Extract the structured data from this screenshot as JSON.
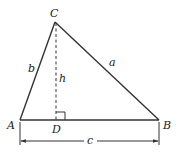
{
  "diagram": {
    "type": "triangle-altitude",
    "vertices": {
      "A": {
        "label": "A",
        "x": 20,
        "y": 120
      },
      "B": {
        "label": "B",
        "x": 159,
        "y": 120
      },
      "C": {
        "label": "C",
        "x": 55,
        "y": 22
      }
    },
    "foot": {
      "label": "D",
      "x": 56,
      "y": 120
    },
    "sides": {
      "a": {
        "label": "a",
        "from": "C",
        "to": "B"
      },
      "b": {
        "label": "b",
        "from": "A",
        "to": "C"
      },
      "c": {
        "label": "c",
        "from": "A",
        "to": "B"
      }
    },
    "altitude": {
      "label": "h",
      "from": "C",
      "to": "D",
      "style": "dashed"
    },
    "right_angle_marker": {
      "at": "D"
    },
    "dimension": {
      "label": "c",
      "from": "A",
      "to": "B"
    },
    "colors": {
      "stroke": "#333333",
      "background": "#ffffff"
    }
  }
}
